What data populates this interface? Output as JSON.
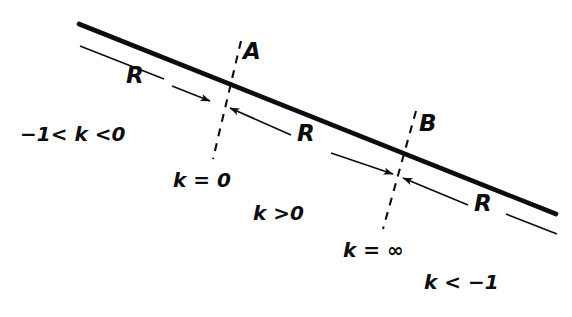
{
  "figure": {
    "background_color": "#ffffff",
    "ink_color": "#0d0d0d",
    "width": 572,
    "height": 317
  },
  "main_line": {
    "name": "thick-diagonal-line",
    "x1": 79,
    "y1": 24,
    "x2": 556,
    "y2": 214,
    "stroke_width": 4.5
  },
  "dashed_lines": [
    {
      "id": "dash-A",
      "x1": 241,
      "y1": 41,
      "x2": 213,
      "y2": 159,
      "dash": "7 6"
    },
    {
      "id": "dash-B",
      "x1": 416,
      "y1": 111,
      "x2": 383,
      "y2": 229,
      "dash": "7 6"
    }
  ],
  "points": [
    {
      "id": "point-A",
      "label": "A",
      "x": 243,
      "y": 40
    },
    {
      "id": "point-B",
      "label": "B",
      "x": 419,
      "y": 112
    }
  ],
  "segments": [
    {
      "id": "segment-left",
      "label": "R",
      "label_x": 126,
      "label_y": 64,
      "leader_line": {
        "x1": 80,
        "y1": 46,
        "x2": 163,
        "y2": 79
      },
      "arrow": {
        "x1": 173,
        "y1": 87,
        "x2": 213,
        "y2": 103,
        "direction": "right"
      }
    },
    {
      "id": "segment-middle",
      "label": "R",
      "label_x": 297,
      "label_y": 122,
      "arrow_in": {
        "x1": 290,
        "y1": 134,
        "x2": 227,
        "y2": 106,
        "direction": "left"
      },
      "arrow_out": {
        "x1": 330,
        "y1": 153,
        "x2": 396,
        "y2": 175,
        "direction": "right"
      }
    },
    {
      "id": "segment-right",
      "label": "R",
      "label_x": 474,
      "label_y": 192,
      "arrow_in": {
        "x1": 467,
        "y1": 204,
        "x2": 400,
        "y2": 177,
        "direction": "left"
      },
      "leader_line": {
        "x1": 505,
        "y1": 213,
        "x2": 557,
        "y2": 234
      }
    }
  ],
  "annotations": [
    {
      "id": "ann-k-between-neg1-and-0",
      "text": "−1< k <0",
      "x": 20,
      "y": 124,
      "parts": {
        "prefix": "−1<",
        "symbol": "k",
        "suffix": "<0"
      }
    },
    {
      "id": "ann-k-equals-0",
      "text": "k = 0",
      "x": 173,
      "y": 170,
      "parts": {
        "prefix": "",
        "symbol": "k",
        "suffix": "= 0"
      }
    },
    {
      "id": "ann-k-greater-0",
      "text": "k >0",
      "x": 253,
      "y": 203,
      "parts": {
        "prefix": "",
        "symbol": "k",
        "suffix": ">0"
      }
    },
    {
      "id": "ann-k-equals-infinity",
      "text": "k = ∞",
      "x": 343,
      "y": 240,
      "parts": {
        "prefix": "",
        "symbol": "k",
        "suffix": "= ∞"
      }
    },
    {
      "id": "ann-k-less-neg1",
      "text": "k < −1",
      "x": 424,
      "y": 272,
      "parts": {
        "prefix": "",
        "symbol": "k",
        "suffix": "< −1"
      }
    }
  ]
}
